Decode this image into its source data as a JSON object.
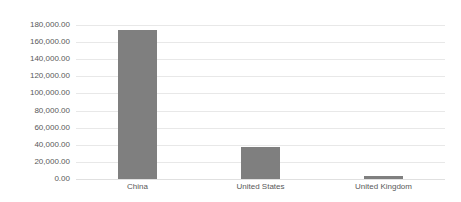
{
  "chart_data": {
    "type": "bar",
    "title": "",
    "subtitle": "",
    "xlabel": "",
    "ylabel": "",
    "categories": [
      "China",
      "United States",
      "United Kingdom"
    ],
    "values": [
      173600,
      37400,
      3500
    ],
    "series": [
      {
        "name": "",
        "values": [
          173600,
          37400,
          3500
        ]
      }
    ],
    "ylim": [
      0,
      180000
    ],
    "ytick_values": [
      0,
      20000,
      40000,
      60000,
      80000,
      100000,
      120000,
      140000,
      160000,
      180000
    ],
    "ytick_labels": [
      "0.00",
      "20,000.00",
      "40,000.00",
      "60,000.00",
      "80,000.00",
      "100,000.00",
      "120,000.00",
      "140,000.00",
      "160,000.00",
      "180,000.00"
    ],
    "grid": "horizontal",
    "legend": "none",
    "bar_color": "#7f7f7f",
    "gridline_color": "#e8e8e8",
    "tick_label_color": "#595959",
    "background_color": "#ffffff"
  }
}
